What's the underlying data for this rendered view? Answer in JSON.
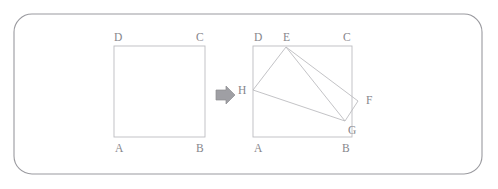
{
  "figure": {
    "background_color": "#ffffff",
    "line_color": "#bcbcc0",
    "frame_color": "#9a9a9f",
    "label_color": "#86868b",
    "arrow_color": "#9f9fa4",
    "frame": {
      "name": "rounded-frame",
      "x": 14,
      "y": 14,
      "width": 468,
      "height": 160,
      "radius": 18
    },
    "arrow": {
      "name": "transformation-arrow",
      "symbol": "right-arrow-outline",
      "x": 216,
      "y": 94
    },
    "left_figure": {
      "name": "original-rectangle",
      "rect": {
        "x": 114,
        "y": 46,
        "width": 91,
        "height": 91
      },
      "vertices": [
        {
          "id": "A",
          "label": "A",
          "x": 114,
          "y": 137,
          "label_x": 115,
          "label_y": 152
        },
        {
          "id": "B",
          "label": "B",
          "x": 205,
          "y": 137,
          "label_x": 196,
          "label_y": 152
        },
        {
          "id": "C",
          "label": "C",
          "x": 205,
          "y": 46,
          "label_x": 196,
          "label_y": 41
        },
        {
          "id": "D",
          "label": "D",
          "x": 114,
          "y": 46,
          "label_x": 114,
          "label_y": 41
        }
      ]
    },
    "right_figure": {
      "name": "transformed-figure",
      "rect": {
        "x": 253,
        "y": 46,
        "width": 99,
        "height": 91
      },
      "base_vertices": [
        {
          "id": "A",
          "label": "A",
          "x": 253,
          "y": 137,
          "label_x": 254,
          "label_y": 152
        },
        {
          "id": "B",
          "label": "B",
          "x": 352,
          "y": 137,
          "label_x": 342,
          "label_y": 152
        },
        {
          "id": "C",
          "label": "C",
          "x": 352,
          "y": 46,
          "label_x": 343,
          "label_y": 41
        },
        {
          "id": "D",
          "label": "D",
          "x": 253,
          "y": 46,
          "label_x": 254,
          "label_y": 41
        }
      ],
      "rotated_rect": {
        "name": "rotated-rectangle-EFGH",
        "points": "286,47 358,101 345,121 253,90",
        "vertices": [
          {
            "id": "E",
            "label": "E",
            "x": 286,
            "y": 47,
            "label_x": 283,
            "label_y": 41
          },
          {
            "id": "F",
            "label": "F",
            "x": 358,
            "y": 101,
            "label_x": 366,
            "label_y": 104
          },
          {
            "id": "G",
            "label": "G",
            "x": 345,
            "y": 121,
            "label_x": 348,
            "label_y": 134
          },
          {
            "id": "H",
            "label": "H",
            "x": 253,
            "y": 90,
            "label_x": 238,
            "label_y": 94
          }
        ]
      },
      "diagonal": {
        "name": "diagonal-EG",
        "x1": 286,
        "y1": 47,
        "x2": 345,
        "y2": 121
      }
    }
  }
}
